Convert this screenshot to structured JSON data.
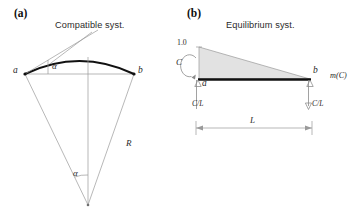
{
  "figure": {
    "panels": [
      {
        "tag": "(a)",
        "title": "Compatible syst.",
        "labels": {
          "node_left": "a",
          "node_right": "b",
          "angle_top": "α",
          "angle_center": "α",
          "radius": "R"
        }
      },
      {
        "tag": "(b)",
        "title": "Equilibrium syst.",
        "labels": {
          "peak_value": "1.0",
          "moment_couple": "C",
          "node_left": "a",
          "node_right": "b",
          "reaction_left": "C/L",
          "reaction_right": "C/L",
          "diagram_name": "m(C)",
          "span": "L"
        }
      }
    ],
    "colors": {
      "stroke_dark": "#111111",
      "stroke_thin": "#8a8a8a",
      "fill_diagram": "#e2e2e2",
      "text": "#1a1a1a",
      "background": "#ffffff"
    }
  }
}
